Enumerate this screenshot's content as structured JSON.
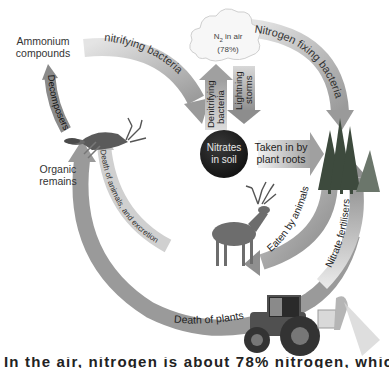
{
  "diagram": {
    "nodes": {
      "air": {
        "label_main": "N",
        "label_sub": "2",
        "label_rest": " in air",
        "label_pct": "(78%)"
      },
      "soil": {
        "line1": "Nitrates",
        "line2": "in soil"
      },
      "ammonium": {
        "line1": "Ammonium",
        "line2": "compounds"
      },
      "organic": {
        "line1": "Organic",
        "line2": "remains"
      }
    },
    "arrows": {
      "nitrifying": "nitrifying bacteria",
      "nitrogen_fixing": "Nitrogen fixing bacteria",
      "denitrifying_1": "Denitrifying",
      "denitrifying_2": "bacteria",
      "lightning_1": "Lightning",
      "lightning_2": "storms",
      "taken_in_1": "Taken in by",
      "taken_in_2": "plant roots",
      "eaten": "Eaten by animals",
      "death_animals": "Death of animals, and excretion",
      "death_plants": "Death of plants",
      "decomposers": "Decomposers",
      "fertilisers": "Nitrate fertilisers"
    },
    "illustrations": [
      "cloud",
      "trees",
      "deer-standing",
      "deer-dead",
      "tractor-sprayer",
      "soil-mound"
    ],
    "colors": {
      "arrow_dark": "#8c8c8c",
      "arrow_mid": "#a9a9a9",
      "arrow_light": "#d2d2d2",
      "soil_circle": "#1e1e1e",
      "tree": "#3d4a3d"
    }
  },
  "caption_cut": "In the air, nitrogen is about 78% nitrogen, which means that... This is about"
}
